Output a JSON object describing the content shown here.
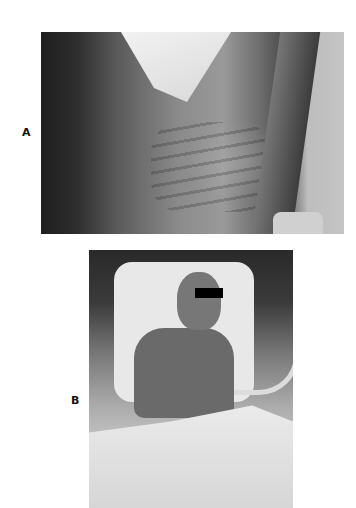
{
  "figure": {
    "panels": [
      {
        "label": "A",
        "description": "Photograph of emaciated patient chest showing prominent ribs, with ECG leads and wrapped wrist"
      },
      {
        "label": "B",
        "description": "Photograph of patient in hospital bed with tracheostomy tubing, ECG leads, eyes obscured by black bar"
      }
    ]
  }
}
